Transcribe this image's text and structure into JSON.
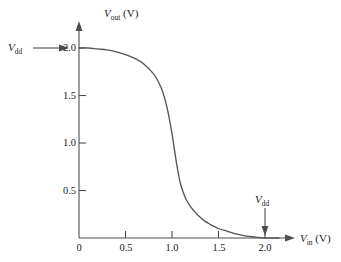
{
  "chart_data": {
    "type": "line",
    "title": "",
    "xlabel": "V_in (V)",
    "ylabel": "V_out (V)",
    "xlim": [
      0,
      2.25
    ],
    "ylim": [
      0,
      2.15
    ],
    "grid": false,
    "legend": "none",
    "xticks": [
      "0",
      "0.5",
      "1.0",
      "1.5",
      "2.0"
    ],
    "xtick_values": [
      0,
      0.5,
      1.0,
      1.5,
      2.0
    ],
    "yticks": [
      "0.5",
      "1.0",
      "1.5",
      "2.0"
    ],
    "ytick_values": [
      0.5,
      1.0,
      1.5,
      2.0
    ],
    "series": [
      {
        "name": "CMOS inverter voltage transfer characteristic",
        "x": [
          0.0,
          0.1,
          0.2,
          0.3,
          0.4,
          0.5,
          0.6,
          0.7,
          0.8,
          0.85,
          0.9,
          0.95,
          1.0,
          1.02,
          1.05,
          1.08,
          1.1,
          1.15,
          1.2,
          1.25,
          1.3,
          1.35,
          1.4,
          1.5,
          1.6,
          1.7,
          1.8,
          1.9,
          2.0,
          2.15
        ],
        "y": [
          2.0,
          2.0,
          1.99,
          1.98,
          1.96,
          1.93,
          1.89,
          1.83,
          1.73,
          1.65,
          1.54,
          1.36,
          1.1,
          0.97,
          0.78,
          0.62,
          0.54,
          0.41,
          0.33,
          0.27,
          0.22,
          0.18,
          0.15,
          0.1,
          0.07,
          0.04,
          0.02,
          0.01,
          0.0,
          0.0
        ]
      }
    ],
    "annotations": [
      {
        "id": "vdd-y-annotation",
        "text": "V_dd",
        "target_axis": "y",
        "target_value": 2.0,
        "arrow": "right"
      },
      {
        "id": "vdd-x-annotation",
        "text": "V_dd",
        "target_axis": "x",
        "target_value": 2.0,
        "arrow": "down"
      }
    ]
  },
  "axes": {
    "y_title": {
      "symbol": "V",
      "subscript": "out",
      "unit": "(V)"
    },
    "x_title": {
      "symbol": "V",
      "subscript": "in",
      "unit": "(V)"
    }
  },
  "annotations": {
    "vdd_left": {
      "symbol": "V",
      "subscript": "dd"
    },
    "vdd_bottom": {
      "symbol": "V",
      "subscript": "dd"
    }
  },
  "tick_labels": {
    "x": [
      "0",
      "0.5",
      "1.0",
      "1.5",
      "2.0"
    ],
    "y": [
      "0.5",
      "1.0",
      "1.5",
      "2.0"
    ]
  },
  "colors": {
    "axis": "#4d4d4d",
    "curve": "#555555",
    "text": "#1a1a1a",
    "background": "#ffffff"
  }
}
